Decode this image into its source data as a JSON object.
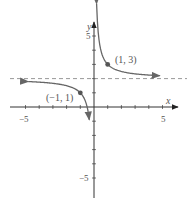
{
  "chart_data": {
    "type": "line",
    "title": "",
    "function": "y = 1/x + 2",
    "xlabel": "x",
    "ylabel": "y",
    "xlim": [
      -5,
      5
    ],
    "ylim": [
      -5,
      5
    ],
    "x_tick_labels": [
      "−5",
      "5"
    ],
    "y_tick_labels": [
      "5",
      "−5"
    ],
    "grid": false,
    "asymptotes": [
      {
        "type": "horizontal",
        "value": 2,
        "style": "dashed"
      },
      {
        "type": "vertical",
        "value": 0
      }
    ],
    "points": [
      {
        "x": 1,
        "y": 3,
        "label": "(1, 3)"
      },
      {
        "x": -1,
        "y": 1,
        "label": "(−1, 1)"
      }
    ],
    "series": [
      {
        "name": "right branch",
        "x": [
          0.18,
          0.25,
          0.35,
          0.5,
          0.75,
          1,
          1.5,
          2,
          3,
          4,
          4.8
        ],
        "y": [
          7.5,
          6,
          4.86,
          4,
          3.33,
          3,
          2.67,
          2.5,
          2.33,
          2.25,
          2.21
        ]
      },
      {
        "name": "left branch",
        "x": [
          -4.8,
          -4,
          -3,
          -2,
          -1.5,
          -1,
          -0.75,
          -0.5,
          -0.4,
          -0.33
        ],
        "y": [
          1.79,
          1.75,
          1.67,
          1.5,
          1.33,
          1,
          0.67,
          0,
          -0.5,
          -1
        ]
      }
    ],
    "colors": {
      "curve": "#666666",
      "asymptote": "#999999",
      "axes": "#444444",
      "point": "#555555"
    }
  },
  "labels": {
    "x_axis": "x",
    "y_axis": "y",
    "x_neg5": "−5",
    "x_pos5": "5",
    "y_pos5": "5",
    "y_neg5": "−5",
    "point_a": "(1, 3)",
    "point_b": "(−1, 1)"
  }
}
